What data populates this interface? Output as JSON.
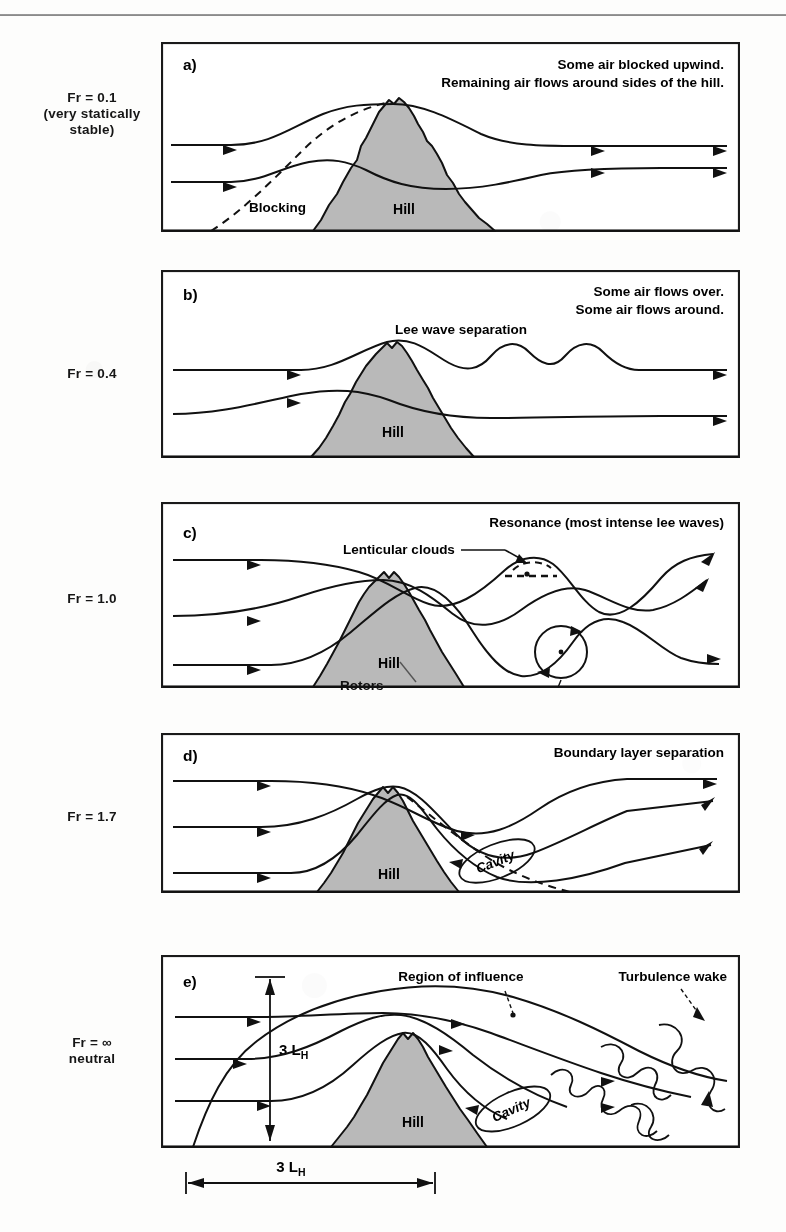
{
  "figure": {
    "kind": "airflow-over-hill-froude-number-diagram",
    "hill_label": "Hill",
    "panel_box": {
      "x": 161,
      "width": 579
    },
    "colors": {
      "hill_fill": "#b9b9b9",
      "stroke": "#111111",
      "panel_border": "#1a1a1a",
      "background": "#fdfdfc",
      "rule": "#7e7e7e"
    }
  },
  "panels": [
    {
      "id": "a",
      "tag": "a)",
      "fr_label": "Fr = 0.1\n(very statically\nstable)",
      "fr_value": "0.1",
      "captions": [
        "Some air blocked upwind.",
        "Remaining air flows around sides of the hill."
      ],
      "annotations": [
        "Blocking"
      ],
      "hill_label": "Hill",
      "box": {
        "x": 161,
        "y": 42,
        "w": 579,
        "h": 190
      }
    },
    {
      "id": "b",
      "tag": "b)",
      "fr_label": "Fr = 0.4",
      "fr_value": "0.4",
      "captions": [
        "Some air flows over.",
        "Some air flows around."
      ],
      "annotations": [
        "Lee wave separation"
      ],
      "hill_label": "Hill",
      "box": {
        "x": 161,
        "y": 270,
        "w": 579,
        "h": 188
      }
    },
    {
      "id": "c",
      "tag": "c)",
      "fr_label": "Fr = 1.0",
      "fr_value": "1.0",
      "captions": [
        "Resonance (most intense lee waves)"
      ],
      "annotations": [
        "Lenticular clouds",
        "Rotors"
      ],
      "hill_label": "Hill",
      "box": {
        "x": 161,
        "y": 502,
        "w": 579,
        "h": 186
      }
    },
    {
      "id": "d",
      "tag": "d)",
      "fr_label": "Fr = 1.7",
      "fr_value": "1.7",
      "captions": [
        "Boundary layer separation"
      ],
      "annotations": [
        "Cavity"
      ],
      "hill_label": "Hill",
      "box": {
        "x": 161,
        "y": 733,
        "w": 579,
        "h": 160
      }
    },
    {
      "id": "e",
      "tag": "e)",
      "fr_label": "Fr = ∞\nneutral",
      "fr_value": "∞",
      "captions": [
        "Region of influence",
        "Turbulence wake"
      ],
      "annotations": [
        "Cavity"
      ],
      "hill_label": "Hill",
      "scale_vertical": {
        "value": "3",
        "unit": "L",
        "subscript": "H"
      },
      "scale_horizontal": {
        "value": "3",
        "unit": "L",
        "subscript": "H"
      },
      "box": {
        "x": 161,
        "y": 955,
        "w": 579,
        "h": 193
      }
    }
  ],
  "scale_bar": {
    "label_value": "3",
    "label_unit": "L",
    "label_subscript": "H",
    "x_start": 186,
    "x_end": 435,
    "y": 1180
  }
}
